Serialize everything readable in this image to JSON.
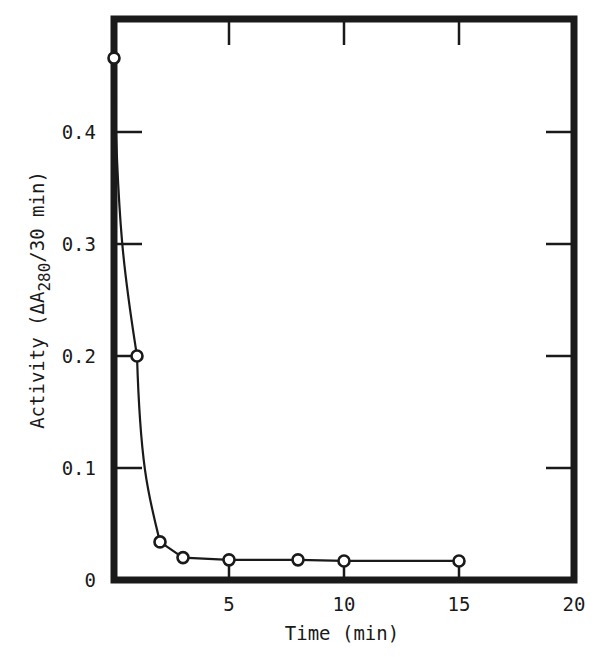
{
  "chart_data": {
    "type": "line",
    "title": "",
    "xlabel": "Time (min)",
    "ylabel": "Activity (ΔA280/30 min)",
    "ylabel_parts": {
      "prefix": "Activity (ΔA",
      "subscript": "280",
      "suffix": "/30 min)"
    },
    "xlim": [
      0,
      20
    ],
    "ylim": [
      0,
      0.5
    ],
    "xticks": [
      0,
      5,
      10,
      15,
      20
    ],
    "xtick_labels": [
      "",
      "5",
      "10",
      "15",
      "20"
    ],
    "yticks": [
      0,
      0.1,
      0.2,
      0.3,
      0.4
    ],
    "ytick_labels": [
      "0",
      "0.1",
      "0.2",
      "0.3",
      "0.4"
    ],
    "grid": false,
    "legend": null,
    "series": [
      {
        "name": "Activity",
        "marker": "open-circle",
        "x": [
          0,
          1,
          2,
          3,
          5,
          8,
          10,
          15
        ],
        "y": [
          0.466,
          0.2,
          0.034,
          0.02,
          0.018,
          0.018,
          0.017,
          0.017
        ]
      }
    ],
    "colors": {
      "ink": "#1a1a1a",
      "background": "#ffffff"
    }
  }
}
